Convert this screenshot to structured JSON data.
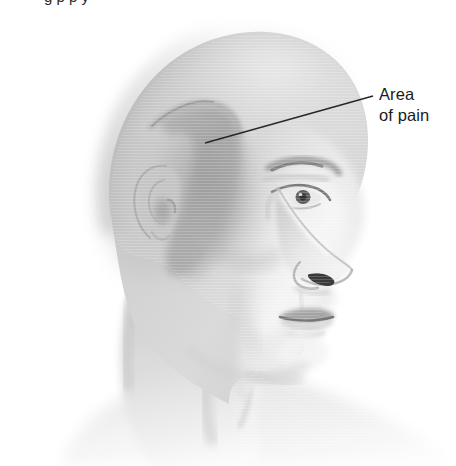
{
  "figure": {
    "background_color": "#ffffff",
    "width": 456,
    "height": 466
  },
  "top_caption": {
    "text": "g p p y",
    "note": "clipped at top edge"
  },
  "callout": {
    "line1": "Area",
    "line2": "of pain",
    "text_color": "#1b1b1b",
    "leader_line": {
      "from_x": 205,
      "from_y": 143,
      "to_x": 373,
      "to_y": 96,
      "color": "#262626"
    }
  },
  "anatomy": {
    "regions": [
      {
        "name": "cranium",
        "label": "Skull / bald crown",
        "tone": "#d4d4d4"
      },
      {
        "name": "pain-area",
        "label": "Area of pain (temporal region)",
        "tone": "#a9a9a9"
      },
      {
        "name": "ear",
        "label": "Ear",
        "tone": "#b6b6b6"
      },
      {
        "name": "face",
        "label": "Face",
        "tone": "#e6e6e6"
      },
      {
        "name": "eye",
        "label": "Eye",
        "tone": "#4a4a4a"
      },
      {
        "name": "eyebrow",
        "label": "Eyebrow",
        "tone": "#8a8a8a"
      },
      {
        "name": "nose",
        "label": "Nose",
        "tone": "#dedede"
      },
      {
        "name": "nostril",
        "label": "Nostril",
        "tone": "#3d3d3d"
      },
      {
        "name": "lips",
        "label": "Lips",
        "tone": "#9c9c9c"
      },
      {
        "name": "chin",
        "label": "Chin",
        "tone": "#ececec"
      },
      {
        "name": "neck",
        "label": "Neck",
        "tone": "#dcdcdc"
      },
      {
        "name": "shoulder",
        "label": "Shoulder",
        "tone": "#f1f1f1"
      }
    ]
  },
  "palette": {
    "ink": "#262626",
    "skull_light": "#dcdcdc",
    "skull_mid": "#cbcbcb",
    "skull_shadow": "#b4b4b4",
    "pain_shade": "#a9a9a9",
    "pain_shade_deep": "#9b9b9b",
    "face_light": "#eeeeee",
    "neck_fade": "#f4f4f4",
    "feature_dark": "#3d3d3d"
  }
}
